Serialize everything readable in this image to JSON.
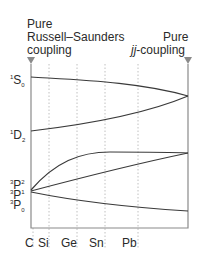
{
  "header": {
    "left_label": [
      "Pure",
      "Russell–Saunders",
      "coupling"
    ],
    "right_label_line1": "Pure",
    "right_label_italic": "jj",
    "right_label_rest": "-coupling"
  },
  "terms": [
    {
      "pre": "1",
      "letter": "S",
      "sub": "0"
    },
    {
      "pre": "1",
      "letter": "D",
      "sub": "2"
    },
    {
      "pre": "3",
      "letter": "P",
      "sub": "2"
    },
    {
      "pre": "3",
      "letter": "P",
      "sub": "1"
    },
    {
      "pre": "3",
      "letter": "P",
      "sub": "0"
    }
  ],
  "elements": [
    "C",
    "Si",
    "Ge",
    "Sn",
    "Pb"
  ],
  "colors": {
    "line": "#3a3a3a",
    "axis": "#8a8a8a",
    "grid": "#b0b0b0"
  }
}
